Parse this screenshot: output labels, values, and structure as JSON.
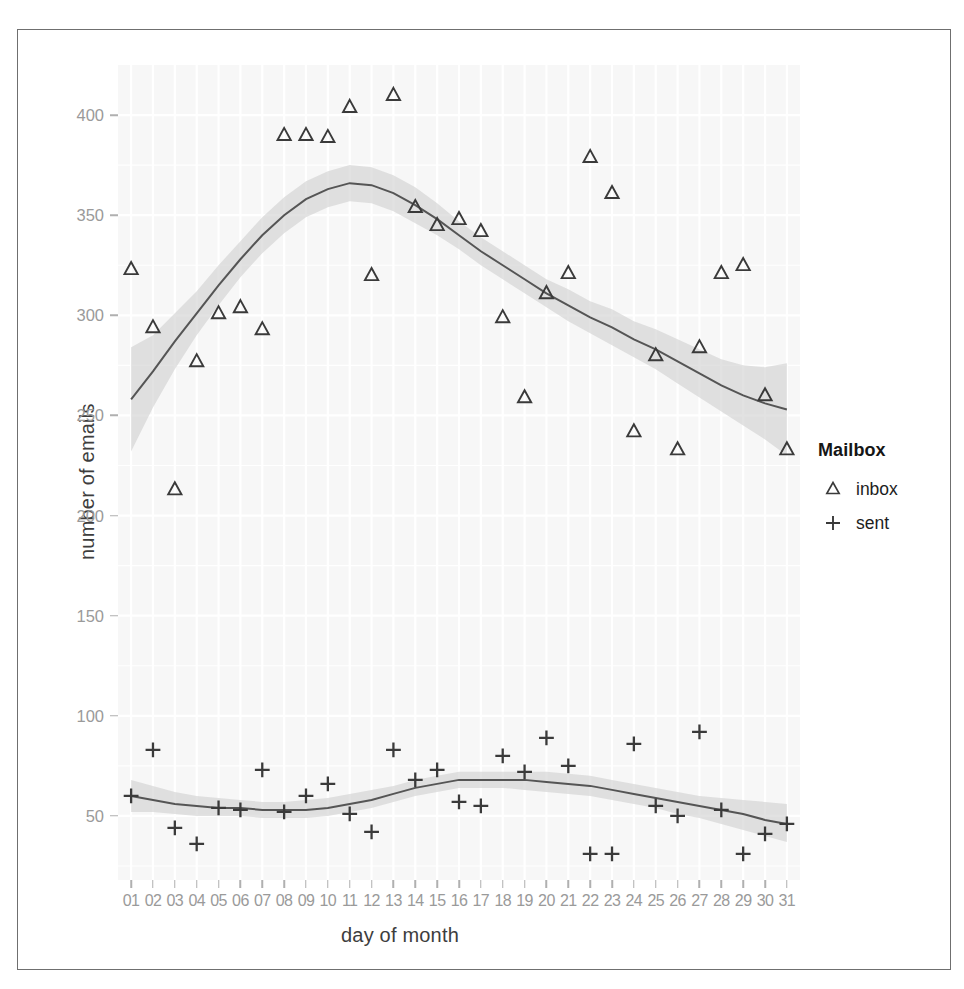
{
  "chart_data": {
    "type": "scatter",
    "title": "",
    "subtitle": "",
    "xlabel": "day of month",
    "ylabel": "number of emails",
    "grid": true,
    "legend_position": "right",
    "legend_title": "Mailbox",
    "xlim": [
      0.4,
      31.6
    ],
    "ylim": [
      18,
      425
    ],
    "x_ticks": [
      "01",
      "02",
      "03",
      "04",
      "05",
      "06",
      "07",
      "08",
      "09",
      "10",
      "11",
      "12",
      "13",
      "14",
      "15",
      "16",
      "17",
      "18",
      "19",
      "20",
      "21",
      "22",
      "23",
      "24",
      "25",
      "26",
      "27",
      "28",
      "29",
      "30",
      "31"
    ],
    "y_ticks": [
      50,
      100,
      150,
      200,
      250,
      300,
      350,
      400
    ],
    "x": [
      1,
      2,
      3,
      4,
      5,
      6,
      7,
      8,
      9,
      10,
      11,
      12,
      13,
      14,
      15,
      16,
      17,
      18,
      19,
      20,
      21,
      22,
      23,
      24,
      25,
      26,
      27,
      28,
      29,
      30,
      31
    ],
    "series": [
      {
        "name": "inbox",
        "marker": "triangle",
        "color": "#3a3a3a",
        "values": [
          323,
          294,
          213,
          277,
          301,
          304,
          293,
          390,
          390,
          389,
          404,
          320,
          410,
          354,
          345,
          348,
          342,
          299,
          259,
          311,
          321,
          379,
          361,
          242,
          280,
          233,
          284,
          321,
          325,
          260,
          233
        ],
        "smooth": {
          "x": [
            1,
            2,
            3,
            4,
            5,
            6,
            7,
            8,
            9,
            10,
            11,
            12,
            13,
            14,
            15,
            16,
            17,
            18,
            19,
            20,
            21,
            22,
            23,
            24,
            25,
            26,
            27,
            28,
            29,
            30,
            31
          ],
          "fit": [
            258,
            272,
            287,
            301,
            315,
            328,
            340,
            350,
            358,
            363,
            366,
            365,
            361,
            355,
            348,
            340,
            332,
            325,
            318,
            311,
            305,
            299,
            294,
            288,
            283,
            277,
            271,
            265,
            260,
            256,
            253
          ],
          "lower": [
            232,
            254,
            273,
            290,
            305,
            319,
            331,
            341,
            349,
            354,
            357,
            356,
            352,
            346,
            340,
            333,
            325,
            318,
            311,
            304,
            297,
            291,
            285,
            279,
            273,
            266,
            259,
            252,
            245,
            238,
            230
          ],
          "upper": [
            284,
            290,
            301,
            312,
            325,
            337,
            349,
            359,
            367,
            372,
            375,
            374,
            370,
            364,
            356,
            347,
            339,
            332,
            325,
            318,
            313,
            307,
            303,
            297,
            293,
            288,
            283,
            278,
            275,
            274,
            276
          ]
        }
      },
      {
        "name": "sent",
        "marker": "plus",
        "color": "#3a3a3a",
        "values": [
          60,
          83,
          44,
          36,
          54,
          53,
          73,
          52,
          60,
          66,
          51,
          42,
          83,
          68,
          73,
          57,
          55,
          80,
          72,
          89,
          75,
          31,
          31,
          86,
          55,
          50,
          92,
          53,
          31,
          41,
          46
        ],
        "smooth": {
          "x": [
            1,
            2,
            3,
            4,
            5,
            6,
            7,
            8,
            9,
            10,
            11,
            12,
            13,
            14,
            15,
            16,
            17,
            18,
            19,
            20,
            21,
            22,
            23,
            24,
            25,
            26,
            27,
            28,
            29,
            30,
            31
          ],
          "fit": [
            60,
            58,
            56,
            55,
            54,
            54,
            53,
            53,
            53,
            54,
            56,
            58,
            61,
            64,
            66,
            68,
            68,
            68,
            68,
            67,
            66,
            65,
            63,
            61,
            59,
            57,
            55,
            53,
            51,
            48,
            46
          ],
          "lower": [
            52,
            52,
            51,
            50,
            50,
            50,
            49,
            49,
            49,
            50,
            52,
            54,
            57,
            60,
            62,
            64,
            64,
            64,
            63,
            62,
            61,
            60,
            58,
            56,
            54,
            51,
            49,
            46,
            43,
            40,
            37
          ],
          "upper": [
            68,
            65,
            62,
            60,
            59,
            58,
            57,
            57,
            58,
            59,
            61,
            63,
            65,
            68,
            70,
            72,
            72,
            72,
            72,
            72,
            71,
            70,
            68,
            66,
            64,
            62,
            60,
            59,
            58,
            57,
            56
          ]
        }
      }
    ]
  },
  "legend": {
    "title": "Mailbox",
    "entries": [
      {
        "label": "inbox",
        "glyph": "triangle-marker"
      },
      {
        "label": "sent",
        "glyph": "plus-marker"
      }
    ]
  },
  "axes": {
    "x_title": "day of month",
    "y_title": "number of emails"
  },
  "colors": {
    "panel_background": "#f7f7f7",
    "grid_line": "#ffffff",
    "tick_text": "#9a9a9a",
    "axis_title_text": "#3d3d3d",
    "marker": "#3a3a3a",
    "smooth_line": "#555555",
    "confidence_band": "#d0d0d0",
    "frame_border": "#6f6f6f"
  }
}
